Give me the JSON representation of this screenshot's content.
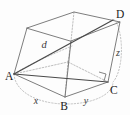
{
  "figure": {
    "name": "rectangular-box-space-diagonal",
    "background_color": "#fdfdfd",
    "solid_edge_color": "#6e6e6e",
    "hidden_edge_color": "#a8a8a8",
    "diagonal_color": "#4a4a4a",
    "guide_arc_color": "#b2b2b2",
    "label_color": "#1b1b1b"
  },
  "vertices": {
    "a": {
      "label": "A",
      "x": 14,
      "y": 76
    },
    "b": {
      "label": "B",
      "x": 65,
      "y": 99
    },
    "c": {
      "label": "C",
      "x": 108,
      "y": 83
    },
    "d": {
      "label": "D",
      "x": 113,
      "y": 20
    }
  },
  "edge_labels": {
    "x": {
      "label": "x",
      "x": 37,
      "y": 101
    },
    "y": {
      "label": "y",
      "x": 85,
      "y": 101
    },
    "z": {
      "label": "z",
      "x": 115,
      "y": 53
    }
  },
  "diagonal_labels": {
    "d": {
      "label": "d",
      "x": 44,
      "y": 45
    }
  },
  "markers": {
    "right_angle_at_c": {
      "present": true,
      "vertex": "C"
    }
  },
  "geometry": {
    "top_face": "27,28 74,12 120,22 71,41",
    "bottom_front": "14,74 65,97 108,82",
    "front_left_edge": "27,28 14,74",
    "front_mid_edge": "71,41 65,97",
    "right_edge": "120,22 108,82",
    "back_hidden_edge": "74,12 71,41",
    "space_diagonal": "14,74 113,20",
    "face_diagonal": "14,74 108,82",
    "hidden_bottom_a_c": "14,74 108,82"
  }
}
